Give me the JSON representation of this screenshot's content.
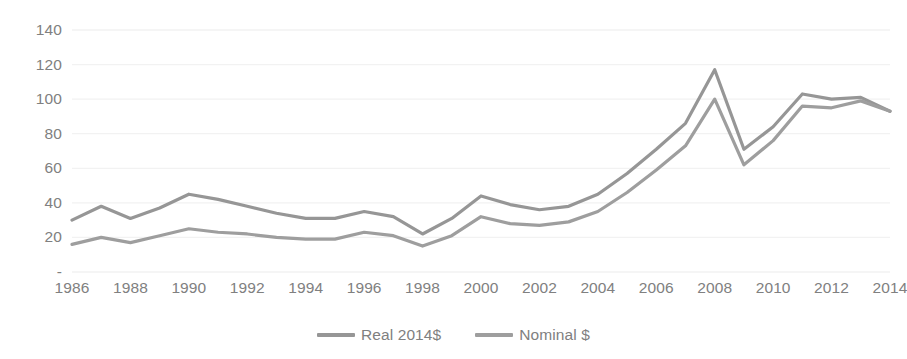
{
  "chart_data": {
    "type": "line",
    "title": "",
    "subtitle": "",
    "xlabel": "",
    "ylabel": "",
    "grid": true,
    "legend_position": "bottom",
    "xlim": [
      1986,
      2014
    ],
    "ylim": [
      0,
      140
    ],
    "x_tick_labels": [
      "1986",
      "1988",
      "1990",
      "1992",
      "1994",
      "1996",
      "1998",
      "2000",
      "2002",
      "2004",
      "2006",
      "2008",
      "2010",
      "2012",
      "2014"
    ],
    "x_tick_values": [
      1986,
      1988,
      1990,
      1992,
      1994,
      1996,
      1998,
      2000,
      2002,
      2004,
      2006,
      2008,
      2010,
      2012,
      2014
    ],
    "y_tick_labels": [
      "140",
      "120",
      "100",
      "80",
      "60",
      "40",
      "20",
      "-"
    ],
    "y_tick_values": [
      140,
      120,
      100,
      80,
      60,
      40,
      20,
      0
    ],
    "x": [
      1986,
      1987,
      1988,
      1989,
      1990,
      1991,
      1992,
      1993,
      1994,
      1995,
      1996,
      1997,
      1998,
      1999,
      2000,
      2001,
      2002,
      2003,
      2004,
      2005,
      2006,
      2007,
      2008,
      2009,
      2010,
      2011,
      2012,
      2013,
      2014
    ],
    "series": [
      {
        "name": "Real 2014$",
        "color": "#969696",
        "values": [
          30,
          38,
          31,
          37,
          45,
          42,
          38,
          34,
          31,
          31,
          35,
          32,
          22,
          31,
          44,
          39,
          36,
          38,
          45,
          57,
          71,
          86,
          117,
          71,
          84,
          103,
          100,
          101,
          93
        ]
      },
      {
        "name": "Nominal $",
        "color": "#9e9e9e",
        "values": [
          16,
          20,
          17,
          21,
          25,
          23,
          22,
          20,
          19,
          19,
          23,
          21,
          15,
          21,
          32,
          28,
          27,
          29,
          35,
          46,
          59,
          73,
          100,
          62,
          76,
          96,
          95,
          99,
          93
        ]
      }
    ]
  },
  "legend": {
    "entries": [
      {
        "label": "Real 2014$",
        "color": "#969696"
      },
      {
        "label": "Nominal $",
        "color": "#9e9e9e"
      }
    ]
  }
}
